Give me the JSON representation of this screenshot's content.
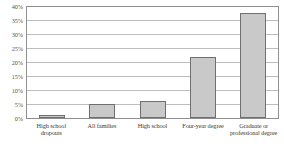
{
  "chart_data": {
    "type": "bar",
    "title": "",
    "subtitle": "",
    "xlabel": "",
    "ylabel": "",
    "categories": [
      "High school dropouts",
      "All families",
      "High school",
      "Four-year degree",
      "Graduate or professional degree"
    ],
    "values": [
      1,
      5,
      6,
      22,
      38
    ],
    "ylim": [
      0,
      40
    ],
    "y_ticks": [
      0,
      5,
      10,
      15,
      20,
      25,
      30,
      35,
      40
    ],
    "y_tick_labels": [
      "0%",
      "5%",
      "10%",
      "15%",
      "20%",
      "25%",
      "30%",
      "35%",
      "40%"
    ],
    "grid": true,
    "legend": false,
    "legend_position": "none",
    "bar_fill_color": "#c9c9c9",
    "bar_border_color": "#6f6f6f",
    "gridline_color": "#bdbdbd",
    "axis_color": "#8e8e8e"
  }
}
